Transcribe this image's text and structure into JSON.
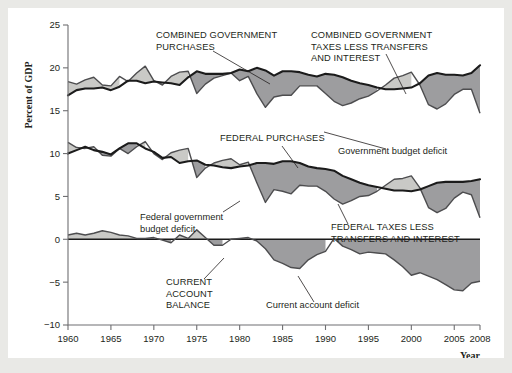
{
  "figure": {
    "background": "#ffffff",
    "page_background": "#e9e9e6",
    "colors": {
      "dark_band": "#9d9d9f",
      "light_band": "#c9c9c6",
      "line": "#1b1b1b",
      "axis": "#6f6f72",
      "text": "#231f20"
    }
  },
  "axes": {
    "ylabel": "Percent of GDP",
    "xlabel": "Year",
    "yticks": [
      25,
      20,
      15,
      10,
      5,
      0,
      -5,
      -10
    ],
    "yticklabels": [
      "25",
      "20",
      "15",
      "10",
      "5",
      "0",
      "−5",
      "−10"
    ],
    "xticks": [
      1960,
      1965,
      1970,
      1975,
      1980,
      1985,
      1990,
      1995,
      2000,
      2005,
      2008
    ],
    "xticklabels": [
      "1960",
      "1965",
      "1970",
      "1975",
      "1980",
      "1985",
      "1990",
      "1995",
      "2000",
      "2005",
      "2008"
    ],
    "ylim": [
      -10,
      25
    ],
    "xlim": [
      1960,
      2008
    ],
    "grid": false
  },
  "annotations": [
    {
      "id": "combined-government-purchases",
      "style": "caps",
      "lines": [
        "COMBINED GOVERNMENT",
        "PURCHASES"
      ],
      "x": 148,
      "y": 30
    },
    {
      "id": "combined-government-taxes",
      "style": "caps",
      "lines": [
        "COMBINED GOVERNMENT",
        "TAXES LESS TRANSFERS",
        "AND INTEREST"
      ],
      "x": 303,
      "y": 30
    },
    {
      "id": "federal-purchases",
      "style": "caps",
      "lines": [
        "FEDERAL PURCHASES"
      ],
      "x": 212,
      "y": 133
    },
    {
      "id": "government-budget-deficit",
      "style": "mixed",
      "lines": [
        "Government budget deficit"
      ],
      "x": 330,
      "y": 146
    },
    {
      "id": "federal-government-budget-deficit",
      "style": "mixed",
      "lines": [
        "Federal government",
        "budget deficit"
      ],
      "x": 132,
      "y": 212
    },
    {
      "id": "federal-taxes-less-transfers",
      "style": "caps",
      "lines": [
        "FEDERAL TAXES LESS",
        "TRANSFERS AND INTEREST"
      ],
      "x": 323,
      "y": 222
    },
    {
      "id": "current-account-balance",
      "style": "caps",
      "lines": [
        "CURRENT",
        "ACCOUNT",
        "BALANCE"
      ],
      "x": 158,
      "y": 277
    },
    {
      "id": "current-account-deficit",
      "style": "mixed",
      "lines": [
        "Current account deficit"
      ],
      "x": 258,
      "y": 300
    }
  ],
  "chart_data": {
    "type": "area",
    "title": "",
    "xlabel": "Year",
    "ylabel": "Percent of GDP",
    "xlim": [
      1960,
      2008
    ],
    "ylim": [
      -10,
      25
    ],
    "grid": false,
    "legend_position": "inline-annotations",
    "x": [
      1960,
      1961,
      1962,
      1963,
      1964,
      1965,
      1966,
      1967,
      1968,
      1969,
      1970,
      1971,
      1972,
      1973,
      1974,
      1975,
      1976,
      1977,
      1978,
      1979,
      1980,
      1981,
      1982,
      1983,
      1984,
      1985,
      1986,
      1987,
      1988,
      1989,
      1990,
      1991,
      1992,
      1993,
      1994,
      1995,
      1996,
      1997,
      1998,
      1999,
      2000,
      2001,
      2002,
      2003,
      2004,
      2005,
      2006,
      2007,
      2008
    ],
    "series": [
      {
        "name": "Combined government purchases",
        "key": "combined_purchases",
        "values": [
          16.8,
          17.4,
          17.6,
          17.6,
          17.7,
          17.4,
          17.8,
          18.5,
          18.5,
          18.2,
          18.4,
          18.3,
          18.2,
          18.0,
          18.9,
          19.6,
          19.3,
          19.3,
          19.3,
          19.4,
          19.8,
          19.6,
          20.0,
          19.7,
          19.1,
          19.6,
          19.6,
          19.5,
          19.2,
          19.0,
          19.3,
          19.2,
          18.9,
          18.5,
          18.2,
          18.0,
          17.7,
          17.5,
          17.5,
          17.6,
          17.7,
          18.2,
          19.1,
          19.4,
          19.2,
          19.2,
          19.1,
          19.4,
          20.3
        ]
      },
      {
        "name": "Combined government taxes less transfers and interest",
        "key": "combined_taxes",
        "values": [
          18.4,
          18.1,
          18.6,
          18.9,
          18.0,
          17.9,
          19.0,
          18.4,
          19.4,
          20.2,
          18.5,
          18.0,
          19.0,
          19.5,
          19.6,
          17.0,
          18.1,
          18.8,
          19.1,
          19.4,
          18.5,
          19.0,
          17.0,
          15.4,
          16.6,
          16.8,
          16.8,
          17.9,
          17.9,
          17.9,
          17.0,
          16.1,
          15.6,
          15.9,
          16.4,
          16.7,
          17.3,
          18.0,
          18.8,
          19.1,
          19.5,
          18.0,
          15.7,
          15.2,
          15.8,
          16.9,
          17.5,
          17.5,
          14.7
        ]
      },
      {
        "name": "Federal purchases",
        "key": "federal_purchases",
        "values": [
          10.0,
          10.4,
          10.8,
          10.4,
          10.2,
          9.9,
          10.6,
          11.2,
          11.2,
          10.6,
          10.2,
          9.5,
          9.6,
          8.9,
          9.1,
          9.2,
          8.7,
          8.6,
          8.4,
          8.3,
          8.5,
          8.6,
          8.9,
          8.9,
          8.8,
          9.1,
          9.1,
          8.9,
          8.5,
          8.3,
          8.2,
          8.0,
          7.4,
          7.0,
          6.6,
          6.3,
          6.1,
          5.9,
          5.7,
          5.7,
          5.6,
          5.8,
          6.2,
          6.6,
          6.7,
          6.7,
          6.7,
          6.8,
          7.0
        ]
      },
      {
        "name": "Federal taxes less transfers and interest",
        "key": "federal_taxes",
        "values": [
          11.3,
          10.7,
          10.6,
          10.8,
          9.8,
          9.7,
          10.6,
          10.0,
          10.8,
          11.4,
          10.0,
          9.3,
          10.1,
          10.4,
          10.6,
          7.2,
          8.3,
          8.9,
          9.2,
          9.4,
          8.7,
          9.0,
          6.6,
          4.3,
          5.8,
          5.6,
          5.3,
          6.3,
          6.2,
          6.2,
          5.6,
          4.7,
          4.1,
          4.5,
          5.0,
          5.1,
          5.6,
          6.3,
          7.0,
          7.1,
          7.4,
          6.0,
          3.7,
          3.1,
          3.6,
          4.8,
          5.5,
          5.2,
          2.5
        ]
      },
      {
        "name": "Current account balance",
        "key": "current_account",
        "values": [
          0.5,
          0.7,
          0.5,
          0.7,
          1.0,
          0.8,
          0.5,
          0.4,
          0.1,
          0.1,
          0.2,
          -0.1,
          -0.4,
          0.5,
          0.1,
          1.1,
          0.2,
          -0.7,
          -0.7,
          0.0,
          0.1,
          0.2,
          -0.2,
          -1.1,
          -2.4,
          -2.8,
          -3.3,
          -3.4,
          -2.4,
          -1.8,
          -1.4,
          0.1,
          -0.8,
          -1.2,
          -1.7,
          -1.5,
          -1.6,
          -1.7,
          -2.4,
          -3.2,
          -4.2,
          -3.9,
          -4.3,
          -4.7,
          -5.3,
          -5.9,
          -6.0,
          -5.1,
          -4.9
        ]
      }
    ]
  }
}
